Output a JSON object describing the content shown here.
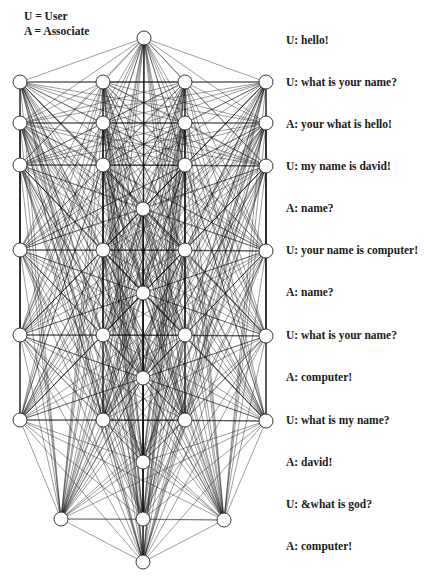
{
  "legend": {
    "user": "U = User",
    "associate": "A = Associate"
  },
  "dialog": [
    {
      "speaker": "U",
      "text": "U: hello!",
      "y": 40
    },
    {
      "speaker": "U",
      "text": "U: what is your name?",
      "y": 82
    },
    {
      "speaker": "A",
      "text": "A: your what is hello!",
      "y": 124
    },
    {
      "speaker": "U",
      "text": "U: my name is david!",
      "y": 166
    },
    {
      "speaker": "A",
      "text": "A: name?",
      "y": 208
    },
    {
      "speaker": "U",
      "text": "U: your name is computer!",
      "y": 250
    },
    {
      "speaker": "A",
      "text": "A: name?",
      "y": 292
    },
    {
      "speaker": "U",
      "text": "U: what is your name?",
      "y": 335
    },
    {
      "speaker": "A",
      "text": "A: computer!",
      "y": 377
    },
    {
      "speaker": "U",
      "text": "U: what is my name?",
      "y": 420
    },
    {
      "speaker": "A",
      "text": "A: david!",
      "y": 462
    },
    {
      "speaker": "U",
      "text": "U: &what is god?",
      "y": 504
    },
    {
      "speaker": "A",
      "text": "A: computer!",
      "y": 546
    }
  ],
  "graph": {
    "node_radius": 7,
    "node_fill": "#ffffff",
    "node_stroke": "#222222",
    "edge_color": "#111111",
    "nodes": [
      [
        144,
        38
      ],
      [
        20,
        82
      ],
      [
        20,
        123
      ],
      [
        20,
        165
      ],
      [
        20,
        250
      ],
      [
        20,
        335
      ],
      [
        20,
        420
      ],
      [
        103,
        82
      ],
      [
        103,
        123
      ],
      [
        103,
        165
      ],
      [
        103,
        250
      ],
      [
        103,
        335
      ],
      [
        103,
        420
      ],
      [
        185,
        82
      ],
      [
        185,
        123
      ],
      [
        185,
        165
      ],
      [
        185,
        250
      ],
      [
        185,
        335
      ],
      [
        185,
        420
      ],
      [
        266,
        82
      ],
      [
        266,
        123
      ],
      [
        266,
        166
      ],
      [
        266,
        251
      ],
      [
        266,
        336
      ],
      [
        266,
        421
      ],
      [
        143,
        209
      ],
      [
        143,
        293
      ],
      [
        143,
        378
      ],
      [
        143,
        462
      ],
      [
        143,
        519
      ],
      [
        143,
        562
      ],
      [
        61,
        519
      ],
      [
        224,
        520
      ]
    ]
  }
}
